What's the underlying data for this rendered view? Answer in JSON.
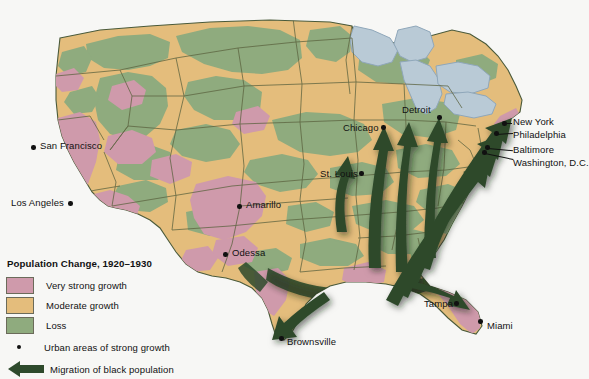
{
  "figure": {
    "kind": "thematic-map",
    "region": "United States (contiguous)",
    "background_color": "#f7f7f5"
  },
  "legend": {
    "title": "Population Change, 1920–1930",
    "categories": [
      {
        "label": "Very strong growth",
        "color": "#cf9aab",
        "swatch_name": "swatch-very-strong-growth"
      },
      {
        "label": "Moderate growth",
        "color": "#e4bd7c",
        "swatch_name": "swatch-moderate-growth"
      },
      {
        "label": "Loss",
        "color": "#8fab7e",
        "swatch_name": "swatch-loss"
      }
    ],
    "symbols": [
      {
        "label": "Urban areas of strong growth",
        "type": "dot",
        "color": "#111111"
      },
      {
        "label": "Migration of black population",
        "type": "arrow",
        "color": "#2e4a2c",
        "direction": "left"
      }
    ]
  },
  "map_colors": {
    "very_strong_growth": "#cf9aab",
    "moderate_growth": "#e4bd7c",
    "loss": "#8fab7e",
    "water": "#b9cad6",
    "water_outline": "#8fa7ba",
    "border": "#5c6340",
    "coastline": "#4a5a3a",
    "arrow": "#2e4a2c",
    "arrow_shadow": "#1d2c1c"
  },
  "cities": [
    {
      "name": "San Francisco",
      "label_x": 40,
      "label_y": 146,
      "dot_x": 33,
      "dot_y": 147,
      "label_side": "right"
    },
    {
      "name": "Los Angeles",
      "label_x": 13,
      "label_y": 205,
      "dot_x": 70,
      "dot_y": 203,
      "label_side": "left"
    },
    {
      "name": "Amarillo",
      "label_x": 246,
      "label_y": 205,
      "dot_x": 239,
      "dot_y": 206,
      "label_side": "right"
    },
    {
      "name": "Odessa",
      "label_x": 232,
      "label_y": 253,
      "dot_x": 225,
      "dot_y": 254,
      "label_side": "right"
    },
    {
      "name": "Brownsville",
      "label_x": 287,
      "label_y": 341,
      "dot_x": 281,
      "dot_y": 338,
      "label_side": "right"
    },
    {
      "name": "St. Louis",
      "label_x": 320,
      "label_y": 175,
      "dot_x": 361,
      "dot_y": 173,
      "label_side": "left"
    },
    {
      "name": "Chicago",
      "label_x": 343,
      "label_y": 128,
      "dot_x": 383,
      "dot_y": 127,
      "label_side": "left"
    },
    {
      "name": "Detroit",
      "label_x": 402,
      "label_y": 110,
      "dot_x": 439,
      "dot_y": 117,
      "label_side": "left"
    },
    {
      "name": "New York",
      "label_x": 513,
      "label_y": 121,
      "dot_x": 504,
      "dot_y": 123,
      "label_side": "right"
    },
    {
      "name": "Philadelphia",
      "label_x": 513,
      "label_y": 134,
      "dot_x": 496,
      "dot_y": 133,
      "label_side": "right"
    },
    {
      "name": "Baltimore",
      "label_x": 513,
      "label_y": 149,
      "dot_x": 487,
      "dot_y": 147,
      "label_side": "right"
    },
    {
      "name": "Washington, D.C.",
      "label_x": 513,
      "label_y": 162,
      "dot_x": 484,
      "dot_y": 152,
      "label_side": "right"
    },
    {
      "name": "Tampa",
      "label_x": 424,
      "label_y": 304,
      "dot_x": 456,
      "dot_y": 303,
      "label_side": "left"
    },
    {
      "name": "Miami",
      "label_x": 487,
      "label_y": 325,
      "dot_x": 480,
      "dot_y": 321,
      "label_side": "right"
    }
  ],
  "migration_arrows": {
    "count": 9,
    "description": "Dark green arrows from the Deep South / Gulf Coast fanning north and northeast toward Chicago, Detroit, and the Northeast cities"
  }
}
